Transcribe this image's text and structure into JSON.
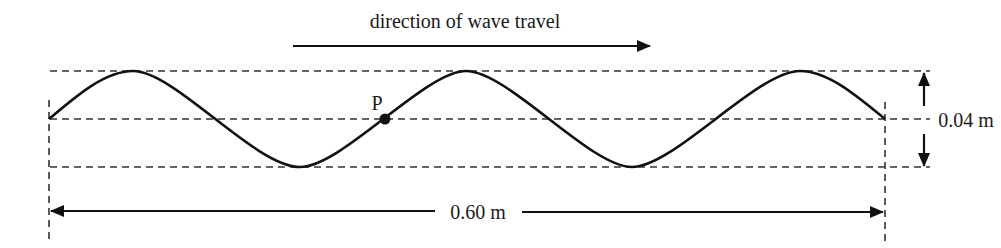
{
  "diagram": {
    "travel_label": "direction of wave travel",
    "point_label": "P",
    "amplitude_label": "0.04 m",
    "length_label": "0.60 m",
    "wavelengths_shown": 2.5,
    "colors": {
      "line": "#111111",
      "dashed": "#333333",
      "background": "#ffffff"
    }
  }
}
